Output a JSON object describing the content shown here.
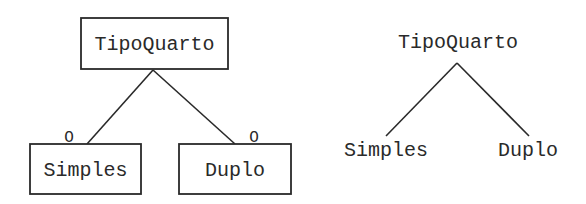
{
  "left_diagram": {
    "notation": "boxed",
    "parent": {
      "label": "TipoQuarto"
    },
    "children": [
      {
        "label": "Simples",
        "marker": "O"
      },
      {
        "label": "Duplo",
        "marker": "O"
      }
    ]
  },
  "right_diagram": {
    "notation": "plain-tree",
    "parent": {
      "label": "TipoQuarto"
    },
    "children": [
      {
        "label": "Simples"
      },
      {
        "label": "Duplo"
      }
    ]
  },
  "colors": {
    "stroke": "#2a2a2a",
    "background": "#ffffff"
  }
}
